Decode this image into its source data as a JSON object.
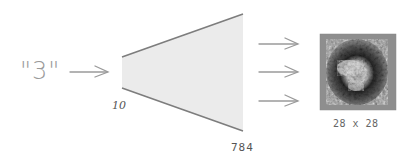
{
  "diagram": {
    "input_label": "\"3\"",
    "decoder": {
      "input_size_label": "10",
      "output_size_label": "784",
      "fill_color": "#ebebeb",
      "stroke_color": "#7d7d7d"
    },
    "output_image": {
      "label": "28 x 28",
      "description": "grayscale 28x28 generated digit image"
    },
    "arrows": {
      "input_arrow_count": 1,
      "output_arrow_count": 3,
      "color": "#9a9a9a"
    }
  }
}
